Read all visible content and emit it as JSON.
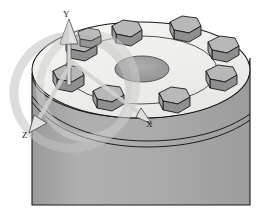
{
  "viewport": {
    "background_color": "#ffffff",
    "render_mode": "shaded-grayscale"
  },
  "model": {
    "name": "hexagonal-boss-cylinder",
    "body": {
      "type": "cylinder",
      "top_face_color": "#f2f2f0",
      "side_face_color": "#a8a8a8",
      "outline_color": "#1a1a1a",
      "groove_count": 2
    },
    "center_hole": {
      "type": "through-hole",
      "shape": "circle",
      "fill_color": "#9a9a9a"
    },
    "bosses": {
      "shape": "hexagonal-prism",
      "count": 8,
      "top_color": "#b4b4b4",
      "front_color": "#8e8e8e",
      "side_color": "#a0a0a0",
      "angles_deg": [
        90,
        135,
        180,
        225,
        270,
        315,
        0,
        45
      ]
    }
  },
  "gizmo": {
    "name": "coordinate-triad",
    "axes": [
      {
        "id": "y",
        "label": "Y",
        "direction": "up",
        "color": "#d8d8d8"
      },
      {
        "id": "x",
        "label": "X",
        "direction": "right-down",
        "color": "#d8d8d8"
      },
      {
        "id": "z",
        "label": "Z",
        "direction": "left-down",
        "color": "#d8d8d8"
      }
    ],
    "rotation_rings": {
      "count": 2,
      "color": "#c9c9c9",
      "opacity": "0.55"
    }
  }
}
